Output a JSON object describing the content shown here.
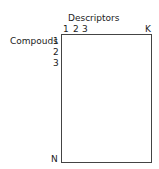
{
  "diagram": {
    "column_axis_title": "Descriptors",
    "column_labels": [
      "1",
      "2",
      "3",
      "K"
    ],
    "row_axis_title": "Compouds",
    "row_labels": [
      "1",
      "2",
      "3",
      "N"
    ]
  }
}
